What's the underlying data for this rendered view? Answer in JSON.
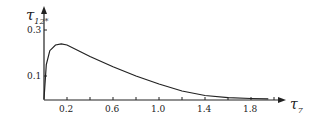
{
  "chart_data": {
    "type": "line",
    "title": "",
    "xlabel": "τ₇",
    "ylabel": "τ₁₂*",
    "xlim": [
      0,
      2.0
    ],
    "ylim": [
      0,
      0.32
    ],
    "x_ticks": [
      "0.2",
      "0.6",
      "1.0",
      "1.4",
      "1.8"
    ],
    "y_ticks": [
      "0.1",
      "0.3"
    ],
    "grid": false,
    "series": [
      {
        "name": "τ12*",
        "x": [
          0.0,
          0.02,
          0.05,
          0.1,
          0.15,
          0.2,
          0.3,
          0.4,
          0.6,
          0.8,
          1.0,
          1.2,
          1.4,
          1.6,
          1.8,
          1.95
        ],
        "values": [
          0.0,
          0.15,
          0.21,
          0.235,
          0.24,
          0.235,
          0.21,
          0.185,
          0.14,
          0.1,
          0.065,
          0.035,
          0.015,
          0.006,
          0.002,
          0.001
        ]
      }
    ]
  },
  "labels": {
    "ylabel": "τ",
    "ysub": "12*",
    "xlabel": "τ",
    "xsub": "7"
  }
}
